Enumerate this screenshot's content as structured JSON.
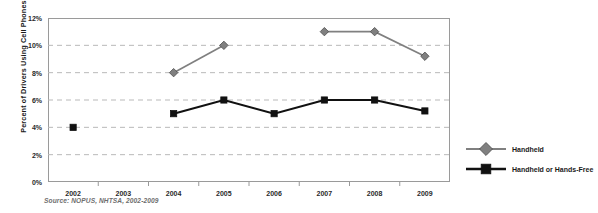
{
  "chart_data": {
    "type": "line",
    "title": "",
    "xlabel": "",
    "ylabel": "Percent of Drivers Using Cell Phones",
    "categories": [
      "2002",
      "2003",
      "2004",
      "2005",
      "2006",
      "2007",
      "2008",
      "2009"
    ],
    "ylim": [
      0,
      12
    ],
    "ytick_step": 2,
    "ytick_labels": [
      "12%",
      "10%",
      "8%",
      "6%",
      "4%",
      "2%",
      "0%"
    ],
    "ytick_values": [
      12,
      10,
      8,
      6,
      4,
      2,
      0
    ],
    "grid": "horizontal-dashed",
    "legend_position": "right",
    "series": [
      {
        "name": "Handheld",
        "marker": "diamond",
        "color": "#808080",
        "values": [
          null,
          null,
          8,
          10,
          null,
          11,
          11,
          9.2
        ]
      },
      {
        "name": "Handheld or Hands-Free",
        "marker": "square",
        "color": "#111111",
        "values": [
          4,
          null,
          5,
          6,
          5,
          6,
          6,
          5.2
        ]
      }
    ],
    "annotations": {
      "source": "Source: NOPUS, NHTSA, 2002-2009"
    }
  },
  "legend": {
    "items": [
      {
        "label": "Handheld"
      },
      {
        "label": "Handheld or Hands-Free"
      }
    ]
  },
  "colors": {
    "handheld": "#808080",
    "handheld_or_hands_free": "#111111",
    "gridline": "#b9b9b9",
    "frame": "#9a9a9a",
    "source_text": "#6e6e6e"
  }
}
